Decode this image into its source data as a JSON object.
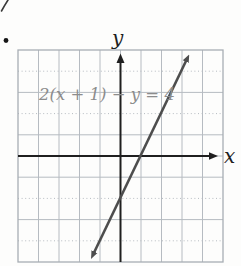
{
  "figure": {
    "corner_mark": "cropped-pen-stroke",
    "bullet": "•",
    "equation_label": "2(x + 1) − y = 4",
    "x_axis_label": "x",
    "y_axis_label": "y"
  },
  "colors": {
    "background": "#fdfdfc",
    "grid": "#b6bbc1",
    "grid_border": "#a8aeb4",
    "axis": "#1f1f1f",
    "line": "#4d4d4d",
    "equation": "#8c8c8c"
  },
  "chart_data": {
    "type": "line",
    "title": "",
    "equation": "2(x + 1) − y = 4",
    "slope_intercept_form": "y = 2x − 2",
    "xlabel": "x",
    "ylabel": "y",
    "xlim": [
      -5,
      5
    ],
    "ylim": [
      -5,
      5
    ],
    "grid": true,
    "legend": false,
    "series": [
      {
        "name": "2(x + 1) − y = 4",
        "slope": 2,
        "y_intercept": -2,
        "x_intercept": 1,
        "points": [
          [
            -1.4,
            -4.8
          ],
          [
            -1,
            -4
          ],
          [
            0,
            -2
          ],
          [
            1,
            0
          ],
          [
            2,
            2
          ],
          [
            3,
            4
          ],
          [
            3.4,
            4.8
          ]
        ],
        "arrows": "both-ends"
      }
    ]
  }
}
